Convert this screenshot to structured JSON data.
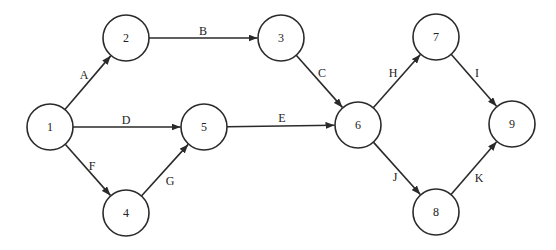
{
  "diagram": {
    "type": "activity-on-arrow network",
    "node_radius": 23,
    "colors": {
      "stroke": "#2a2a2a",
      "text": "#222222",
      "background": "#ffffff"
    },
    "nodes": [
      {
        "id": "1",
        "label": "1",
        "x": 50,
        "y": 127
      },
      {
        "id": "2",
        "label": "2",
        "x": 126,
        "y": 38
      },
      {
        "id": "3",
        "label": "3",
        "x": 281,
        "y": 38
      },
      {
        "id": "4",
        "label": "4",
        "x": 126,
        "y": 213
      },
      {
        "id": "5",
        "label": "5",
        "x": 204,
        "y": 127
      },
      {
        "id": "6",
        "label": "6",
        "x": 358,
        "y": 125
      },
      {
        "id": "7",
        "label": "7",
        "x": 436,
        "y": 37
      },
      {
        "id": "8",
        "label": "8",
        "x": 436,
        "y": 212
      },
      {
        "id": "9",
        "label": "9",
        "x": 512,
        "y": 124
      }
    ],
    "edges": [
      {
        "label": "A",
        "from": "1",
        "to": "2",
        "lx": 84,
        "ly": 75
      },
      {
        "label": "B",
        "from": "2",
        "to": "3",
        "lx": 203,
        "ly": 31
      },
      {
        "label": "C",
        "from": "3",
        "to": "6",
        "lx": 322,
        "ly": 73
      },
      {
        "label": "D",
        "from": "1",
        "to": "5",
        "lx": 126,
        "ly": 120
      },
      {
        "label": "E",
        "from": "5",
        "to": "6",
        "lx": 282,
        "ly": 118
      },
      {
        "label": "F",
        "from": "1",
        "to": "4",
        "lx": 92,
        "ly": 166
      },
      {
        "label": "G",
        "from": "4",
        "to": "5",
        "lx": 170,
        "ly": 181
      },
      {
        "label": "H",
        "from": "6",
        "to": "7",
        "lx": 393,
        "ly": 73
      },
      {
        "label": "I",
        "from": "7",
        "to": "9",
        "lx": 477,
        "ly": 73
      },
      {
        "label": "J",
        "from": "6",
        "to": "8",
        "lx": 395,
        "ly": 177
      },
      {
        "label": "K",
        "from": "8",
        "to": "9",
        "lx": 479,
        "ly": 178
      }
    ]
  }
}
